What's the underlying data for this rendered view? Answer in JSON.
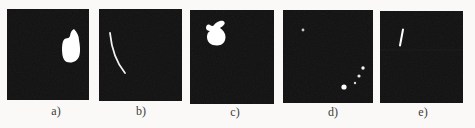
{
  "figure": {
    "type": "binary-mask-panel-row",
    "background_color": "#faf9f7",
    "panel_background_color": "#0b0b0b",
    "mask_color": "#ffffff",
    "label_color": "#3c3c3c",
    "panels": [
      {
        "id": "a",
        "label": "a)",
        "x": 7,
        "y": 9,
        "width": 82,
        "height": 91,
        "label_center_x": 56,
        "label_y": 105,
        "content_description": "large solid boot-shaped blob right of center with pointed top tip and notched upper-left edge",
        "shapes": [
          {
            "type": "path",
            "d": "M67,20 C70,23 72,27 72,31 C73,36 73.5,42 72.5,46 C71.5,51 67,53.5 63,53.5 C58,53.5 56,50 55.3,45 C54.8,40 55,36 55.8,33 C56.6,30 58.5,29.2 60,29.2 C62,29.2 63,28 63.2,26 C63.6,23 65,21 67,20 Z",
            "fill": "#ffffff"
          }
        ]
      },
      {
        "id": "b",
        "label": "b)",
        "x": 99,
        "y": 9,
        "width": 83,
        "height": 92,
        "label_center_x": 141,
        "label_y": 105,
        "content_description": "thin bright streak curving from upper left down to lower middle",
        "shapes": [
          {
            "type": "path",
            "d": "M11,24 Q13.5,49 26,64",
            "fill": "none",
            "stroke": "#f2f2f2",
            "stroke_width": 1.8
          }
        ]
      },
      {
        "id": "c",
        "label": "c)",
        "x": 190,
        "y": 10,
        "width": 84,
        "height": 94,
        "label_center_x": 235,
        "label_y": 106,
        "content_description": "irregular rabbit-like blob in upper-left quadrant with small ear lobe at top right and bump at top left",
        "shapes": [
          {
            "type": "path",
            "d": "M30,11 C33,10 35.5,12 34.5,14 C33.5,16 31,17 30,18 C33,20 35.5,23 35.5,27 C35.5,32 32,35.5 27,35.5 C21,35.5 17,32 17,27 C17,24 18,22 20,21 C18,21 16,20 16,18 C16,15 18,13.8 20,15 C22,16.2 23,16.2 24,15 C25.2,13 27,12 30,11 Z",
            "fill": "#ffffff"
          }
        ]
      },
      {
        "id": "d",
        "label": "d)",
        "x": 283,
        "y": 10,
        "width": 90,
        "height": 93,
        "label_center_x": 333,
        "label_y": 106,
        "content_description": "sparse speckles: one dim dot upper left, diagonal trail of four dots in lower right with largest at its lower end",
        "shapes": [
          {
            "type": "dot",
            "cx": 20,
            "cy": 20,
            "r": 1.4,
            "fill": "#c8c8c8"
          },
          {
            "type": "dot",
            "cx": 80,
            "cy": 58,
            "r": 1.7,
            "fill": "#f5f5f5"
          },
          {
            "type": "dot",
            "cx": 76,
            "cy": 66,
            "r": 1.6,
            "fill": "#e8e8e8"
          },
          {
            "type": "dot",
            "cx": 72,
            "cy": 73,
            "r": 1.2,
            "fill": "#d8d8d8"
          },
          {
            "type": "dot",
            "cx": 61,
            "cy": 77,
            "r": 2.6,
            "fill": "#ffffff"
          }
        ]
      },
      {
        "id": "e",
        "label": "e)",
        "x": 380,
        "y": 11,
        "width": 83,
        "height": 92,
        "label_center_x": 423,
        "label_y": 106,
        "content_description": "short bright near-vertical tick in upper-left area and faint horizontal scan streak",
        "shapes": [
          {
            "type": "path",
            "d": "M23,18.5 L20,34.5",
            "fill": "none",
            "stroke": "#ffffff",
            "stroke_width": 2
          },
          {
            "type": "path",
            "d": "M0,39 L83,39",
            "fill": "none",
            "stroke": "#1d1d1d",
            "stroke_width": 1.2
          }
        ]
      }
    ]
  }
}
